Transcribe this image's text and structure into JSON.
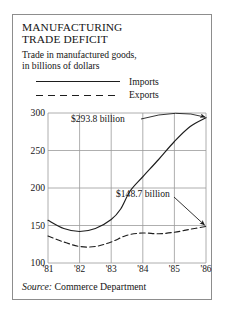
{
  "figure": {
    "title": "MANUFACTURING\nTRADE DEFICIT",
    "subtitle": "Trade in manufactured goods,\nin billions of dollars",
    "source_label": "Source:",
    "source_value": "Commerce Department"
  },
  "legend": {
    "position": "top",
    "items": [
      {
        "label": "Imports",
        "style": "solid",
        "key_name": "legend-key-imports"
      },
      {
        "label": "Exports",
        "style": "dashed",
        "key_name": "legend-key-exports"
      }
    ]
  },
  "colors": {
    "line": "#1d1d1d",
    "grid": "#9a9a9a",
    "axis": "#6f6f6f",
    "border": "#8d8d8d",
    "text": "#151515"
  },
  "chart_data": {
    "type": "line",
    "title": "MANUFACTURING TRADE DEFICIT",
    "subtitle": "Trade in manufactured goods, in billions of dollars",
    "xlabel": "",
    "ylabel": "",
    "grid": true,
    "legend_position": "top",
    "x": [
      "'81",
      "'82",
      "'83",
      "'84",
      "'85",
      "'86"
    ],
    "xtick_labels": [
      "'81",
      "'82",
      "'83",
      "'84",
      "'85",
      "'86"
    ],
    "ytick_labels": [
      "100",
      "150",
      "200",
      "250",
      "300"
    ],
    "ylim": [
      100,
      300
    ],
    "xlim": [
      1981,
      1986
    ],
    "series": [
      {
        "name": "Imports",
        "style": "solid",
        "x": [
          1981,
          1981.5,
          1982,
          1982.5,
          1983,
          1983.3,
          1983.6,
          1984,
          1984.5,
          1985,
          1985.5,
          1986
        ],
        "values": [
          157,
          146,
          142,
          146,
          158,
          172,
          196,
          215,
          238,
          262,
          282,
          293.8
        ]
      },
      {
        "name": "Exports",
        "style": "dashed",
        "x": [
          1981,
          1981.5,
          1982,
          1982.5,
          1983,
          1983.5,
          1984,
          1984.5,
          1985,
          1985.5,
          1986
        ],
        "values": [
          136,
          128,
          122,
          122,
          128,
          137,
          140,
          139,
          141,
          145,
          148.7
        ]
      }
    ],
    "annotations": [
      {
        "text": "$293.8 billion",
        "series": "Imports",
        "value": 293.8,
        "at_x": "'86"
      },
      {
        "text": "$148.7 billion",
        "series": "Exports",
        "value": 148.7,
        "at_x": "'86"
      }
    ]
  }
}
